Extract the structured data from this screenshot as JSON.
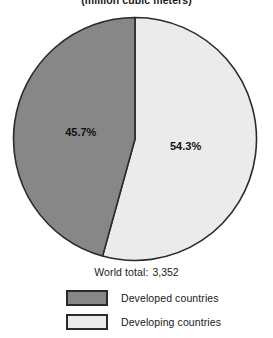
{
  "chart_data": {
    "type": "pie",
    "title": "",
    "subtitle": "(million cubic meters)",
    "categories": [
      "Developed countries",
      "Developing countries"
    ],
    "values": [
      45.7,
      54.3
    ],
    "value_labels": [
      "45.7%",
      "54.3%"
    ],
    "colors": [
      "#878787",
      "#ebebeb"
    ],
    "total_label": "World total:",
    "total_value": "3,352",
    "units": "million cubic meters",
    "start_angle_deg": 0,
    "legend_position": "bottom",
    "grid": false,
    "slices": [
      {
        "name": "Developed countries",
        "percent": 45.7,
        "label": "45.7%",
        "color": "#878787",
        "direction": "counter-clockwise-from-top"
      },
      {
        "name": "Developing countries",
        "percent": 54.3,
        "label": "54.3%",
        "color": "#ebebeb",
        "direction": "clockwise-from-top"
      }
    ]
  },
  "subtitle": "(million cubic meters)",
  "pie": {
    "left_label": "45.7%",
    "right_label": "54.3%"
  },
  "footer": {
    "total_label": "World total:",
    "total_value": "3,352"
  },
  "legend": {
    "items": [
      {
        "label": "Developed countries",
        "color": "#878787"
      },
      {
        "label": "Developing countries",
        "color": "#ebebeb"
      }
    ]
  }
}
